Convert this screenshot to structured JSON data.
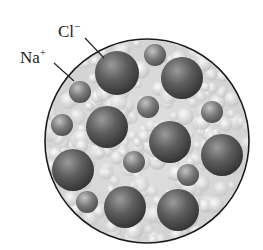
{
  "labels": {
    "chloride": {
      "symbol": "Cl",
      "charge": "−"
    },
    "sodium": {
      "symbol": "Na",
      "charge": "+"
    }
  },
  "colors": {
    "background": "#ffffff",
    "outline": "#1a1a1a",
    "fill_light": "#e6e6e6",
    "anion_dark": "#3c3c3c",
    "anion_light": "#8e8e8e",
    "cation_dark": "#555555",
    "cation_light": "#a8a8a8"
  },
  "circle": {
    "cx": 147,
    "cy": 141,
    "r": 102
  },
  "anions_cl": [
    {
      "cx": 117,
      "cy": 73,
      "r": 22
    },
    {
      "cx": 182,
      "cy": 78,
      "r": 21
    },
    {
      "cx": 107,
      "cy": 127,
      "r": 21
    },
    {
      "cx": 170,
      "cy": 142,
      "r": 21
    },
    {
      "cx": 222,
      "cy": 155,
      "r": 21
    },
    {
      "cx": 73,
      "cy": 170,
      "r": 21
    },
    {
      "cx": 125,
      "cy": 207,
      "r": 21
    },
    {
      "cx": 178,
      "cy": 210,
      "r": 21
    }
  ],
  "cations_na": [
    {
      "cx": 155,
      "cy": 55,
      "r": 11
    },
    {
      "cx": 80,
      "cy": 92,
      "r": 11
    },
    {
      "cx": 148,
      "cy": 107,
      "r": 11
    },
    {
      "cx": 212,
      "cy": 112,
      "r": 11
    },
    {
      "cx": 62,
      "cy": 125,
      "r": 11
    },
    {
      "cx": 134,
      "cy": 162,
      "r": 11
    },
    {
      "cx": 188,
      "cy": 175,
      "r": 11
    },
    {
      "cx": 87,
      "cy": 202,
      "r": 11
    }
  ],
  "leader_lines": {
    "chloride": {
      "x1": 85,
      "y1": 38,
      "x2": 104,
      "y2": 58
    },
    "sodium": {
      "x1": 54,
      "y1": 63,
      "x2": 74,
      "y2": 81
    }
  }
}
